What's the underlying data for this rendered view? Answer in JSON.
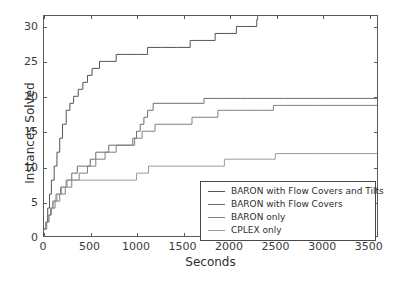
{
  "chart_data": {
    "type": "line",
    "subtype": "step-post",
    "title": "",
    "xlabel": "Seconds",
    "ylabel": "Instances Solved",
    "xlim": [
      0,
      3600
    ],
    "ylim": [
      0,
      31.5
    ],
    "xticks": [
      0,
      500,
      1000,
      1500,
      2000,
      2500,
      3000,
      3500
    ],
    "xtick_labels": [
      "0",
      "500",
      "1000",
      "1500",
      "2000",
      "2500",
      "3000",
      "3500"
    ],
    "yticks": [
      0,
      5,
      10,
      15,
      20,
      25,
      30
    ],
    "ytick_labels": [
      "0",
      "5",
      "10",
      "15",
      "20",
      "25",
      "30"
    ],
    "grid": false,
    "legend_position": "lower right",
    "series": [
      {
        "name": "BARON with Flow Covers and Tilts",
        "color": "#555555",
        "x": [
          0,
          20,
          40,
          60,
          80,
          110,
          140,
          170,
          200,
          240,
          280,
          320,
          370,
          420,
          470,
          520,
          600,
          690,
          780,
          900,
          1010,
          1120,
          1270,
          1430,
          1580,
          1700,
          1850,
          1980,
          2080,
          2180,
          2300,
          2310
        ],
        "y": [
          1,
          2,
          4,
          6,
          8,
          10,
          12,
          14,
          16,
          18,
          19,
          20,
          21,
          22,
          23,
          24,
          25,
          25,
          26,
          26,
          26,
          27,
          27,
          27,
          28,
          28,
          29,
          29,
          30,
          30,
          31,
          31.5
        ]
      },
      {
        "name": "BARON with Flow Covers",
        "color": "#6e6e6e",
        "x": [
          0,
          25,
          45,
          70,
          95,
          130,
          180,
          240,
          300,
          360,
          430,
          500,
          560,
          700,
          860,
          960,
          1000,
          1040,
          1080,
          1120,
          1180,
          1300,
          1450,
          1600,
          1730,
          1900,
          2200,
          2600,
          3000,
          3600
        ],
        "y": [
          1,
          2,
          3,
          4,
          5,
          6,
          7,
          8,
          9,
          10,
          10,
          11,
          12,
          13,
          13,
          14,
          15,
          16,
          17,
          18,
          19,
          19,
          19,
          19,
          19.7,
          19.7,
          19.7,
          19.7,
          19.7,
          19.7
        ]
      },
      {
        "name": "BARON only",
        "color": "#808080",
        "x": [
          0,
          30,
          55,
          80,
          120,
          170,
          230,
          300,
          380,
          470,
          560,
          660,
          780,
          900,
          980,
          1000,
          1060,
          1120,
          1200,
          1330,
          1480,
          1600,
          1700,
          1880,
          2050,
          2200,
          2350,
          2480,
          2600,
          2900,
          3200,
          3600
        ],
        "y": [
          1,
          2,
          3,
          4,
          5,
          6,
          7,
          8,
          9,
          10,
          11,
          12,
          13,
          13,
          14,
          14,
          15,
          15,
          16,
          16,
          16,
          17,
          17,
          18,
          18,
          18,
          18,
          18.7,
          18.7,
          18.7,
          18.7,
          18.7
        ]
      },
      {
        "name": "CPLEX only",
        "color": "#9a9a9a",
        "x": [
          0,
          25,
          50,
          75,
          100,
          140,
          190,
          250,
          320,
          400,
          500,
          700,
          950,
          1000,
          1130,
          1300,
          1600,
          1880,
          1950,
          2150,
          2400,
          2500,
          2900,
          3200,
          3600
        ],
        "y": [
          1,
          2,
          3,
          4,
          5,
          6,
          7,
          8,
          8,
          8,
          8,
          8,
          8,
          9,
          10,
          10,
          10,
          10,
          11,
          11,
          11,
          11.8,
          11.8,
          11.8,
          11.8
        ]
      }
    ]
  },
  "legend": {
    "items": [
      {
        "label": "BARON with Flow Covers and Tilts",
        "color": "#555555"
      },
      {
        "label": "BARON with Flow Covers",
        "color": "#6e6e6e"
      },
      {
        "label": "BARON only",
        "color": "#808080"
      },
      {
        "label": "CPLEX only",
        "color": "#9a9a9a"
      }
    ]
  },
  "axes": {
    "x_title": "Seconds",
    "y_title": "Instances Solved"
  }
}
